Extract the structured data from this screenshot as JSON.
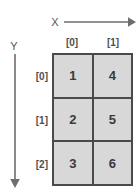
{
  "diagram": {
    "background_color": "#ffffff",
    "cell_fill_color": "#d8d8d8",
    "border_color": "#4a4a4a",
    "text_color": "#3a3a3a",
    "axes": {
      "x": {
        "label": "X",
        "direction": "right",
        "arrow_icon": "arrow-right-icon"
      },
      "y": {
        "label": "Y",
        "direction": "down",
        "arrow_icon": "arrow-down-icon"
      }
    },
    "column_headers": [
      "[0]",
      "[1]"
    ],
    "row_headers": [
      "[0]",
      "[1]",
      "[2]"
    ],
    "grid": {
      "columns": 2,
      "rows": 3,
      "order": "column-major",
      "cells": [
        [
          "1",
          "4"
        ],
        [
          "2",
          "5"
        ],
        [
          "3",
          "6"
        ]
      ]
    }
  }
}
